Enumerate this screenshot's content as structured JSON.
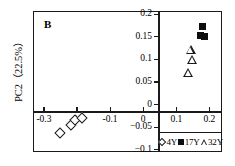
{
  "panel": {
    "label": "B"
  },
  "axes": {
    "ylabel": "PC2（22.5%）",
    "xlabel": "",
    "yticks": [
      "0.2",
      "0.15",
      "0.1",
      "0.05",
      "0",
      "-0.05",
      "-0.1"
    ],
    "xticks": [
      "-0.3",
      "-0.2",
      "-0.1",
      "0",
      "0.1",
      "0.2"
    ]
  },
  "legend": {
    "items": [
      {
        "marker": "diamond-open-icon",
        "label": "4Y"
      },
      {
        "marker": "square-filled-icon",
        "label": "17Y"
      },
      {
        "marker": "triangle-open-icon",
        "label": "32Y"
      }
    ]
  },
  "chart_data": {
    "type": "scatter",
    "title": "B",
    "xlabel": "",
    "ylabel": "PC2（22.5%）",
    "xlim": [
      -0.33,
      0.235
    ],
    "ylim": [
      -0.105,
      0.205
    ],
    "xticks": [
      -0.3,
      -0.2,
      -0.1,
      0,
      0.1,
      0.2
    ],
    "yticks": [
      -0.1,
      -0.05,
      0,
      0.05,
      0.1,
      0.15,
      0.2
    ],
    "grid": false,
    "legend_position": "bottom-right-inside",
    "axis_style": "crossed-at-origin",
    "series": [
      {
        "name": "4Y",
        "marker": "diamond-open",
        "color": "#1a1a1a",
        "points": [
          {
            "x": -0.252,
            "y": -0.062
          },
          {
            "x": -0.218,
            "y": -0.046
          },
          {
            "x": -0.205,
            "y": -0.035
          },
          {
            "x": -0.186,
            "y": -0.03
          }
        ]
      },
      {
        "name": "17Y",
        "marker": "square-filled",
        "color": "#0d0d0d",
        "points": [
          {
            "x": 0.18,
            "y": 0.172
          },
          {
            "x": 0.172,
            "y": 0.152
          },
          {
            "x": 0.186,
            "y": 0.15
          }
        ]
      },
      {
        "name": "32Y",
        "marker": "triangle-open",
        "color": "#1a1a1a",
        "points": [
          {
            "x": 0.143,
            "y": 0.122
          },
          {
            "x": 0.148,
            "y": 0.1
          },
          {
            "x": 0.136,
            "y": 0.07
          }
        ]
      }
    ]
  }
}
